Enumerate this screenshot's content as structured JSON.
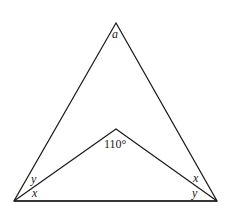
{
  "diagram": {
    "type": "geometry",
    "stroke_color": "#1a1a1a",
    "background": "#ffffff",
    "labels": {
      "apex_angle": "a",
      "inner_angle": "110°",
      "left_upper": "y",
      "left_lower": "x",
      "right_upper": "x",
      "right_lower": "y"
    }
  }
}
